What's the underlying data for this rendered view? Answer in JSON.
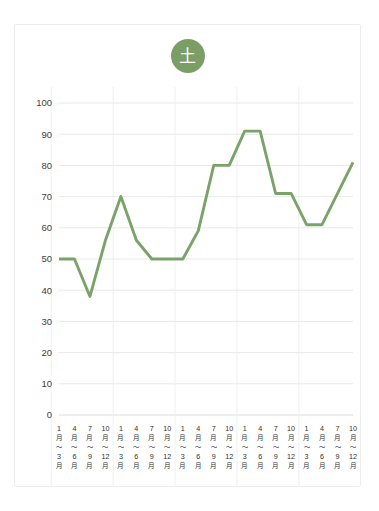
{
  "card": {
    "badge_label": "土",
    "badge_color": "#7a9e66"
  },
  "chart_data": {
    "type": "line",
    "title": "土",
    "xlabel": "",
    "ylabel": "",
    "ylim": [
      0,
      100
    ],
    "ytick_step": 10,
    "yticks": [
      0,
      10,
      20,
      30,
      40,
      50,
      60,
      70,
      80,
      90,
      100
    ],
    "grid": true,
    "legend": "none",
    "line_color": "#7aa36a",
    "quarter_labels": [
      {
        "from_num": "1",
        "from_unit": "月",
        "tilde": "〜",
        "to_num": "3",
        "to_unit": "月"
      },
      {
        "from_num": "4",
        "from_unit": "月",
        "tilde": "〜",
        "to_num": "6",
        "to_unit": "月"
      },
      {
        "from_num": "7",
        "from_unit": "月",
        "tilde": "〜",
        "to_num": "9",
        "to_unit": "月"
      },
      {
        "from_num": "10",
        "from_unit": "月",
        "tilde": "〜",
        "to_num": "12",
        "to_unit": "月"
      }
    ],
    "years": [
      "2025年",
      "2026年",
      "2027年",
      "2028年",
      "2029年"
    ],
    "categories": [
      "2025年 1月〜3月",
      "2025年 4月〜6月",
      "2025年 7月〜9月",
      "2025年 10月〜12月",
      "2026年 1月〜3月",
      "2026年 4月〜6月",
      "2026年 7月〜9月",
      "2026年 10月〜12月",
      "2027年 1月〜3月",
      "2027年 4月〜6月",
      "2027年 7月〜9月",
      "2027年 10月〜12月",
      "2028年 1月〜3月",
      "2028年 4月〜6月",
      "2028年 7月〜9月",
      "2028年 10月〜12月",
      "2029年 1月〜3月",
      "2029年 4月〜6月",
      "2029年 7月〜9月",
      "2029年 10月〜12月"
    ],
    "values": [
      50,
      50,
      38,
      70,
      50,
      50,
      50,
      80,
      80,
      91,
      91,
      71,
      71,
      61,
      61,
      81,
      50,
      50,
      50,
      50
    ],
    "series": [
      {
        "name": "土",
        "points": [
          {
            "x": 0,
            "label": "2025年 1月〜3月",
            "y": 50
          },
          {
            "x": 1,
            "label": "2025年 4月〜6月",
            "y": 50
          },
          {
            "x": 2,
            "label": "2025年 7月〜9月",
            "y": 38
          },
          {
            "x": 3,
            "label": "2025年 10月〜12月",
            "y": 56
          },
          {
            "x": 4,
            "label": "2026年 1月〜3月",
            "y": 70
          },
          {
            "x": 5,
            "label": "2026年 4月〜6月",
            "y": 56
          },
          {
            "x": 6,
            "label": "2026年 7月〜9月",
            "y": 50
          },
          {
            "x": 7,
            "label": "2026年 10月〜12月",
            "y": 50
          },
          {
            "x": 8,
            "label": "2027年 1月〜3月",
            "y": 50
          },
          {
            "x": 9,
            "label": "2027年 4月〜6月",
            "y": 59
          },
          {
            "x": 10,
            "label": "2027年 7月〜9月",
            "y": 80
          },
          {
            "x": 11,
            "label": "2027年 10月〜12月",
            "y": 80
          },
          {
            "x": 12,
            "label": "2028年 1月〜3月",
            "y": 91
          },
          {
            "x": 13,
            "label": "2028年 4月〜6月",
            "y": 91
          },
          {
            "x": 14,
            "label": "2028年 7月〜9月",
            "y": 71
          },
          {
            "x": 15,
            "label": "2028年 10月〜12月",
            "y": 71
          },
          {
            "x": 16,
            "label": "2029年 1月〜3月",
            "y": 61
          },
          {
            "x": 17,
            "label": "2029年 4月〜6月",
            "y": 61
          },
          {
            "x": 18,
            "label": "2029年 7月〜9月",
            "y": 71
          },
          {
            "x": 19,
            "label": "2029年 10月〜12月",
            "y": 81
          }
        ]
      }
    ]
  }
}
